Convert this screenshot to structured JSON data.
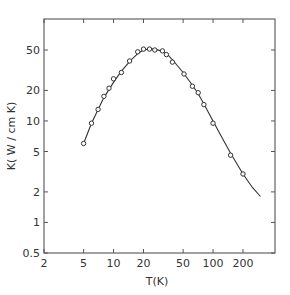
{
  "chart_data": {
    "type": "line",
    "title": "",
    "xlabel": "T(K)",
    "ylabel": "K( W / cm K)",
    "xscale": "log",
    "yscale": "log",
    "xlim": [
      2,
      400
    ],
    "ylim": [
      0.5,
      100
    ],
    "x_ticks": [
      2,
      5,
      10,
      20,
      50,
      100,
      200
    ],
    "x_tick_labels": [
      "2",
      "5",
      "10",
      "20",
      "50",
      "100",
      "200"
    ],
    "y_ticks": [
      0.5,
      1,
      2,
      5,
      10,
      20,
      50
    ],
    "y_tick_labels": [
      "0.5",
      "1",
      "2",
      "5",
      "10",
      "20",
      "50"
    ],
    "grid": false,
    "legend": null,
    "series": [
      {
        "name": "measured",
        "style": "markers",
        "x": [
          5,
          6,
          7,
          8,
          9,
          10,
          12,
          14.5,
          17.5,
          20,
          23,
          26,
          31,
          34,
          39,
          51,
          62,
          71,
          81,
          100,
          150,
          200
        ],
        "y": [
          6,
          9.5,
          13,
          17.5,
          21,
          26,
          30,
          39,
          48,
          51,
          51,
          50,
          49,
          45,
          38,
          29,
          22,
          19,
          14.5,
          9.5,
          4.6,
          3
        ]
      },
      {
        "name": "theory",
        "style": "line",
        "x": [
          5,
          6,
          7,
          8,
          10,
          12,
          15,
          18,
          20,
          23,
          26,
          30,
          35,
          40,
          50,
          60,
          70,
          80,
          100,
          130,
          150,
          200,
          250,
          300
        ],
        "y": [
          6,
          9.5,
          13,
          17,
          24,
          31,
          40,
          47,
          50,
          51.5,
          51,
          49,
          45,
          39,
          30,
          23.5,
          19,
          15,
          10,
          6.2,
          4.8,
          3.0,
          2.2,
          1.8
        ]
      }
    ]
  },
  "axis_labels": {
    "x": "T(K)",
    "y": "K( W / cm K)"
  }
}
